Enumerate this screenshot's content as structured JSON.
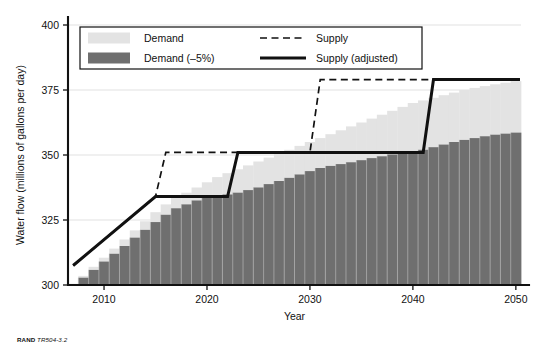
{
  "credit": {
    "org": "RAND",
    "ref": "TR504-3.2"
  },
  "chart_data": {
    "type": "bar",
    "title": "",
    "xlabel": "Year",
    "ylabel": "Water flow (millions of gallons per day)",
    "xlim": [
      2006.5,
      2050.5
    ],
    "ylim": [
      300,
      400
    ],
    "yticks": [
      300,
      325,
      350,
      375,
      400
    ],
    "ytick_labels": [
      "300",
      "325",
      "350",
      "375",
      "400"
    ],
    "xticks": [
      2010,
      2020,
      2030,
      2040,
      2050
    ],
    "xtick_labels": [
      "2010",
      "2020",
      "2030",
      "2040",
      "2050"
    ],
    "grid": "horizontal-light",
    "legend_position": "top-left-inside",
    "colors": {
      "demand": "#e3e3e3",
      "demand_reduced": "#6f6f6f",
      "supply": "#111111",
      "supply_adjusted": "#111111",
      "axis": "#111111",
      "gridline": "#d9d9d9",
      "background": "#ffffff"
    },
    "legend": [
      {
        "label": "Demand",
        "type": "swatch",
        "color": "#e3e3e3"
      },
      {
        "label": "Demand (–5%)",
        "type": "swatch",
        "color": "#6f6f6f"
      },
      {
        "label": "Supply",
        "type": "line-dashed",
        "color": "#111111"
      },
      {
        "label": "Supply (adjusted)",
        "type": "line-solid",
        "color": "#111111"
      }
    ],
    "x": [
      2007,
      2008,
      2009,
      2010,
      2011,
      2012,
      2013,
      2014,
      2015,
      2016,
      2017,
      2018,
      2019,
      2020,
      2021,
      2022,
      2023,
      2024,
      2025,
      2026,
      2027,
      2028,
      2029,
      2030,
      2031,
      2032,
      2033,
      2034,
      2035,
      2036,
      2037,
      2038,
      2039,
      2040,
      2041,
      2042,
      2043,
      2044,
      2045,
      2046,
      2047,
      2048,
      2049,
      2050
    ],
    "series": [
      {
        "name": "Demand",
        "type": "bar",
        "color": "#e3e3e3",
        "values": [
          300.5,
          303.5,
          307.0,
          310.5,
          314.0,
          317.5,
          321.0,
          324.5,
          328.0,
          331.0,
          333.5,
          335.5,
          337.5,
          339.5,
          341.5,
          343.0,
          344.5,
          346.0,
          347.5,
          349.0,
          350.5,
          352.0,
          353.5,
          355.0,
          356.5,
          358.0,
          359.5,
          361.0,
          362.5,
          364.0,
          365.5,
          367.0,
          368.5,
          370.0,
          371.0,
          372.0,
          373.0,
          374.0,
          375.0,
          375.8,
          376.5,
          377.2,
          377.8,
          378.4
        ]
      },
      {
        "name": "Demand (–5%)",
        "type": "bar",
        "color": "#6f6f6f",
        "values": [
          300.2,
          302.8,
          305.8,
          309.0,
          312.0,
          315.0,
          318.2,
          321.2,
          324.2,
          327.0,
          329.5,
          331.0,
          332.5,
          333.5,
          334.2,
          334.8,
          335.5,
          336.5,
          337.5,
          338.8,
          340.0,
          341.2,
          342.5,
          343.8,
          345.0,
          345.8,
          346.5,
          347.2,
          348.0,
          348.8,
          349.5,
          350.2,
          350.8,
          351.2,
          352.0,
          353.0,
          354.0,
          355.0,
          355.8,
          356.5,
          357.2,
          357.8,
          358.2,
          358.6
        ]
      },
      {
        "name": "Supply",
        "type": "step-line-dashed",
        "color": "#111111",
        "points": [
          [
            2007,
            307.5
          ],
          [
            2015,
            334.0
          ],
          [
            2016,
            351.0
          ],
          [
            2030,
            351.0
          ],
          [
            2031,
            379.0
          ],
          [
            2050.4,
            379.0
          ]
        ]
      },
      {
        "name": "Supply (adjusted)",
        "type": "step-line-solid",
        "color": "#111111",
        "points": [
          [
            2007,
            307.5
          ],
          [
            2015,
            334.0
          ],
          [
            2022,
            334.0
          ],
          [
            2023,
            351.0
          ],
          [
            2041,
            351.0
          ],
          [
            2042,
            379.0
          ],
          [
            2050.4,
            379.0
          ]
        ]
      }
    ],
    "annotations": []
  }
}
